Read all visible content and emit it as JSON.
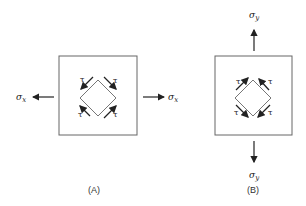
{
  "panels": [
    {
      "id": "A",
      "caption": "(A)",
      "stress_label": "σ",
      "stress_subscript": "x",
      "shear_label": "τ",
      "load_direction": "horizontal"
    },
    {
      "id": "B",
      "caption": "(B)",
      "stress_label": "σ",
      "stress_subscript": "y",
      "shear_label": "τ",
      "load_direction": "vertical"
    }
  ],
  "colors": {
    "line": "#555555",
    "arrow": "#222222",
    "background": "#ffffff"
  }
}
